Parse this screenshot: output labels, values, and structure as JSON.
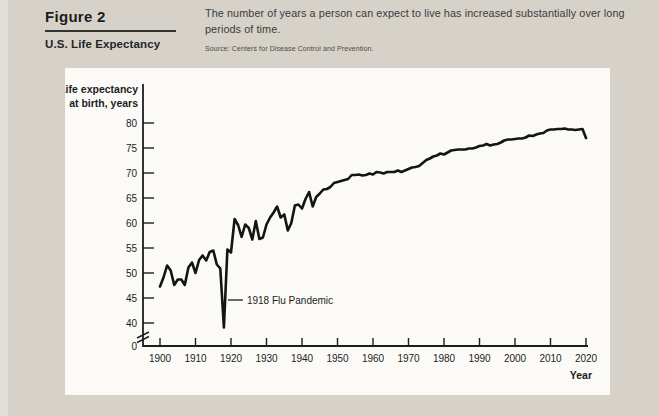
{
  "figure": {
    "label": "Figure 2",
    "title": "U.S. Life Expectancy"
  },
  "caption": {
    "text": "The number of years a person can expect to live has increased substantially over long periods of time."
  },
  "source": {
    "text": "Source: Centers for Disease Control and Prevention."
  },
  "colors": {
    "page_background": "#d6d2c9",
    "panel_background": "#fbfaf6",
    "ink": "#1d1d1d",
    "line": "#141414"
  },
  "chart_data": {
    "type": "line",
    "title": "",
    "ylabel_line1": "Life expectancy",
    "ylabel_line2": "at birth, years",
    "xlabel": "Year",
    "x_ticks": [
      1900,
      1910,
      1920,
      1930,
      1940,
      1950,
      1960,
      1970,
      1980,
      1990,
      2000,
      2010,
      2020
    ],
    "y_ticks": [
      40,
      45,
      50,
      55,
      60,
      65,
      70,
      75,
      80
    ],
    "y_origin_label": "0",
    "axis_break": true,
    "ylim_displayed": [
      40,
      82
    ],
    "grid": false,
    "legend": "none",
    "annotation": {
      "text": "1918 Flu Pandemic",
      "year": 1918,
      "value": 39.1,
      "label_value": 44.6
    },
    "years": [
      1900,
      1901,
      1902,
      1903,
      1904,
      1905,
      1906,
      1907,
      1908,
      1909,
      1910,
      1911,
      1912,
      1913,
      1914,
      1915,
      1916,
      1917,
      1918,
      1919,
      1920,
      1921,
      1922,
      1923,
      1924,
      1925,
      1926,
      1927,
      1928,
      1929,
      1930,
      1931,
      1932,
      1933,
      1934,
      1935,
      1936,
      1937,
      1938,
      1939,
      1940,
      1941,
      1942,
      1943,
      1944,
      1945,
      1946,
      1947,
      1948,
      1949,
      1950,
      1951,
      1952,
      1953,
      1954,
      1955,
      1956,
      1957,
      1958,
      1959,
      1960,
      1961,
      1962,
      1963,
      1964,
      1965,
      1966,
      1967,
      1968,
      1969,
      1970,
      1971,
      1972,
      1973,
      1974,
      1975,
      1976,
      1977,
      1978,
      1979,
      1980,
      1981,
      1982,
      1983,
      1984,
      1985,
      1986,
      1987,
      1988,
      1989,
      1990,
      1991,
      1992,
      1993,
      1994,
      1995,
      1996,
      1997,
      1998,
      1999,
      2000,
      2001,
      2002,
      2003,
      2004,
      2005,
      2006,
      2007,
      2008,
      2009,
      2010,
      2011,
      2012,
      2013,
      2014,
      2015,
      2016,
      2017,
      2018,
      2019,
      2020
    ],
    "values": [
      47.3,
      49.1,
      51.5,
      50.5,
      47.6,
      48.7,
      48.7,
      47.6,
      51.1,
      52.1,
      50.0,
      52.6,
      53.5,
      52.5,
      54.2,
      54.5,
      51.7,
      50.9,
      39.1,
      54.7,
      54.1,
      60.8,
      59.6,
      57.2,
      59.7,
      59.0,
      56.7,
      60.4,
      56.8,
      57.1,
      59.7,
      61.1,
      62.1,
      63.3,
      61.1,
      61.7,
      58.5,
      60.0,
      63.5,
      63.7,
      62.9,
      64.8,
      66.2,
      63.3,
      65.2,
      65.9,
      66.7,
      66.8,
      67.2,
      68.0,
      68.2,
      68.4,
      68.6,
      68.8,
      69.6,
      69.6,
      69.7,
      69.5,
      69.6,
      69.9,
      69.7,
      70.2,
      70.1,
      69.9,
      70.2,
      70.2,
      70.2,
      70.5,
      70.2,
      70.5,
      70.8,
      71.1,
      71.2,
      71.4,
      72.0,
      72.6,
      72.9,
      73.3,
      73.5,
      73.9,
      73.7,
      74.1,
      74.5,
      74.6,
      74.7,
      74.7,
      74.7,
      74.9,
      74.9,
      75.1,
      75.4,
      75.5,
      75.8,
      75.5,
      75.7,
      75.8,
      76.1,
      76.5,
      76.7,
      76.7,
      76.8,
      76.9,
      76.9,
      77.1,
      77.5,
      77.4,
      77.7,
      77.9,
      78.0,
      78.5,
      78.7,
      78.7,
      78.8,
      78.8,
      78.9,
      78.7,
      78.7,
      78.6,
      78.7,
      78.8,
      77.0
    ],
    "line_color": "#141414"
  }
}
